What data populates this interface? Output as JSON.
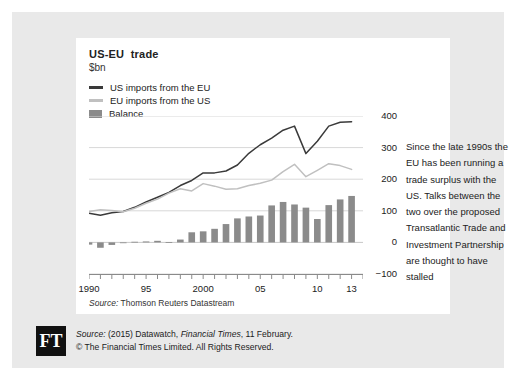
{
  "chart": {
    "title": "US-EU  trade",
    "unit": "$bn",
    "source": "Source: Thomson Reuters Datastream",
    "source_prefix": "Source:",
    "source_rest": " Thomson Reuters Datastream"
  },
  "legend": {
    "items": [
      {
        "label": "US imports from the EU",
        "color": "#3a3a3a",
        "shape": "line"
      },
      {
        "label": "EU imports from the US",
        "color": "#c0c0c0",
        "shape": "line"
      },
      {
        "label": "Balance",
        "color": "#8b8b8b",
        "shape": "box"
      }
    ]
  },
  "annotation": {
    "text": "Since the late 1990s the EU has been running a trade surplus with the US. Talks between the two over the proposed Transatlantic Trade and Investment Partnership are thought to have stalled"
  },
  "footer": {
    "line1_prefix": "Source:",
    "line1_mid": " (2015) Datawatch, ",
    "line1_ital": "Financial Times",
    "line1_suffix": ", 11 February.",
    "line2": "© The Financial Times Limited. All Rights Reserved.",
    "logo": "FT"
  },
  "chart_data": {
    "type": "line",
    "title": "US-EU trade",
    "subtitle": "$bn",
    "xlabel": "",
    "ylabel": "$bn",
    "ylim": [
      -100,
      400
    ],
    "yticks": [
      400,
      300,
      200,
      100,
      0,
      -100
    ],
    "ytick_labels": [
      "400",
      "300",
      "200",
      "100",
      "0",
      "−100"
    ],
    "xlim": [
      1990,
      2014
    ],
    "xticks": [
      1990,
      1995,
      2000,
      2005,
      2010,
      2013
    ],
    "xtick_labels": [
      "1990",
      "95",
      "2000",
      "05",
      "10",
      "13"
    ],
    "grid": true,
    "legend_position": "top-left",
    "x": [
      1990,
      1991,
      1992,
      1993,
      1994,
      1995,
      1996,
      1997,
      1998,
      1999,
      2000,
      2001,
      2002,
      2003,
      2004,
      2005,
      2006,
      2007,
      2008,
      2009,
      2010,
      2011,
      2012,
      2013
    ],
    "series": [
      {
        "name": "US imports from the EU",
        "type": "line",
        "color": "#3a3a3a",
        "values": [
          92,
          86,
          94,
          98,
          111,
          128,
          143,
          158,
          180,
          196,
          220,
          220,
          226,
          245,
          282,
          309,
          330,
          355,
          368,
          281,
          320,
          368,
          380,
          382
        ]
      },
      {
        "name": "EU imports from the US",
        "type": "line",
        "color": "#c0c0c0",
        "values": [
          98,
          103,
          101,
          97,
          108,
          124,
          137,
          156,
          170,
          163,
          186,
          178,
          168,
          170,
          180,
          187,
          197,
          224,
          247,
          208,
          228,
          249,
          243,
          231
        ]
      },
      {
        "name": "Balance",
        "type": "bar",
        "color": "#8b8b8b",
        "values": [
          -7,
          -17,
          -8,
          0,
          2,
          3,
          5,
          1,
          9,
          32,
          35,
          43,
          58,
          76,
          82,
          85,
          117,
          128,
          120,
          110,
          74,
          118,
          136,
          147
        ]
      }
    ]
  }
}
